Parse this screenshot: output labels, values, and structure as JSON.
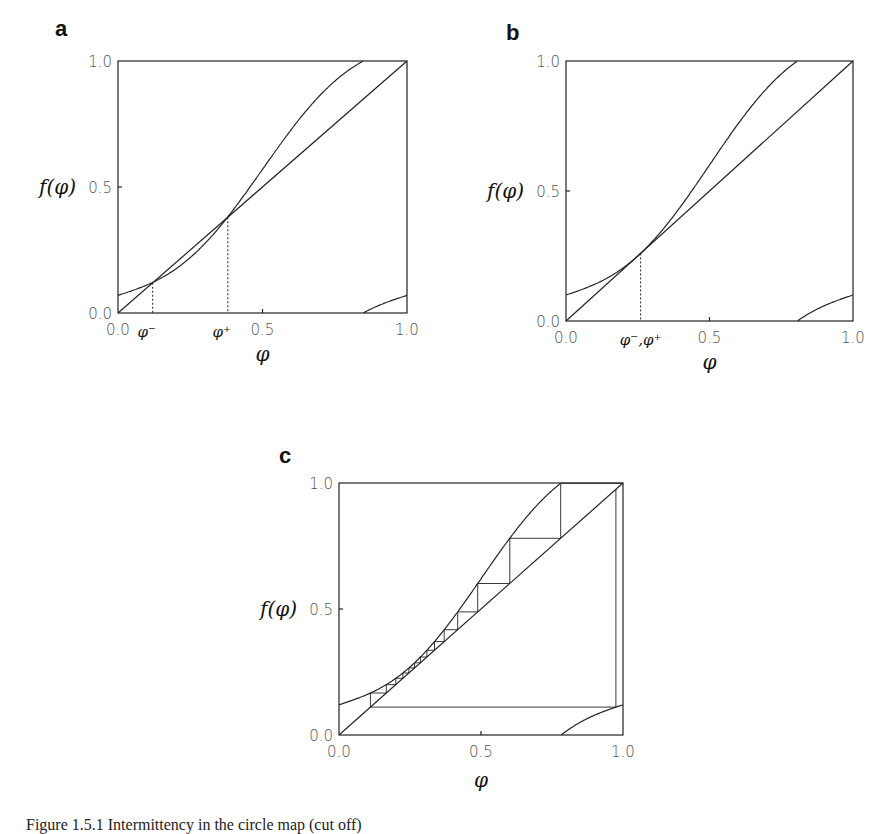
{
  "panels": [
    {
      "id": "a",
      "label": "a",
      "ylabel": "f(φ)",
      "xlabel": "φ",
      "xticks": [
        "0.0",
        "0.5",
        "1.0"
      ],
      "yticks": [
        "0.0",
        "0.5",
        "1.0"
      ],
      "annotations": [
        "φ⁻",
        "φ⁺"
      ]
    },
    {
      "id": "b",
      "label": "b",
      "ylabel": "f(φ)",
      "xlabel": "φ",
      "xticks": [
        "0.0",
        "0.5",
        "1.0"
      ],
      "yticks": [
        "0.0",
        "0.5",
        "1.0"
      ],
      "annotations": [
        "φ⁻,φ⁺"
      ]
    },
    {
      "id": "c",
      "label": "c",
      "ylabel": "f(φ)",
      "xlabel": "φ",
      "xticks": [
        "0.0",
        "0.5",
        "1.0"
      ],
      "yticks": [
        "0.0",
        "0.5",
        "1.0"
      ],
      "annotations": []
    }
  ],
  "caption": "Figure 1.5.1   Intermittency in the circle map (cut off)",
  "chart_data": [
    {
      "type": "line",
      "title": "a",
      "xlabel": "φ",
      "ylabel": "f(φ)",
      "xlim": [
        0,
        1
      ],
      "ylim": [
        0,
        1
      ],
      "grid": false,
      "series": [
        {
          "name": "f(φ) = φ + 0.07 − 0.1·sin(2πφ) mod 1",
          "b": 0.07,
          "amp": 0.1
        },
        {
          "name": "diagonal f(φ)=φ",
          "x": [
            0,
            1
          ],
          "y": [
            0,
            1
          ]
        }
      ],
      "fixed_points": {
        "phi_minus": 0.12,
        "phi_plus": 0.38
      },
      "box": {
        "left": 118,
        "top": 61,
        "right": 407,
        "bottom": 313
      }
    },
    {
      "type": "line",
      "title": "b",
      "xlabel": "φ",
      "ylabel": "f(φ)",
      "xlim": [
        0,
        1
      ],
      "ylim": [
        0,
        1
      ],
      "grid": false,
      "series": [
        {
          "name": "f(φ) = φ + 0.10 − 0.1·sin(2πφ) mod 1",
          "b": 0.1,
          "amp": 0.1
        },
        {
          "name": "diagonal f(φ)=φ",
          "x": [
            0,
            1
          ],
          "y": [
            0,
            1
          ]
        }
      ],
      "fixed_points": {
        "phi_minus_plus": 0.26
      },
      "box": {
        "left": 566,
        "top": 61,
        "right": 853,
        "bottom": 321
      }
    },
    {
      "type": "line",
      "title": "c",
      "xlabel": "φ",
      "ylabel": "f(φ)",
      "xlim": [
        0,
        1
      ],
      "ylim": [
        0,
        1
      ],
      "grid": false,
      "series": [
        {
          "name": "f(φ) = φ + 0.12 − 0.1·sin(2πφ) mod 1",
          "b": 0.12,
          "amp": 0.1
        },
        {
          "name": "diagonal f(φ)=φ",
          "x": [
            0,
            1
          ],
          "y": [
            0,
            1
          ]
        },
        {
          "name": "cobweb iteration",
          "start": 0.975,
          "steps": 40
        }
      ],
      "box": {
        "left": 339,
        "top": 483,
        "right": 623,
        "bottom": 735
      }
    }
  ]
}
